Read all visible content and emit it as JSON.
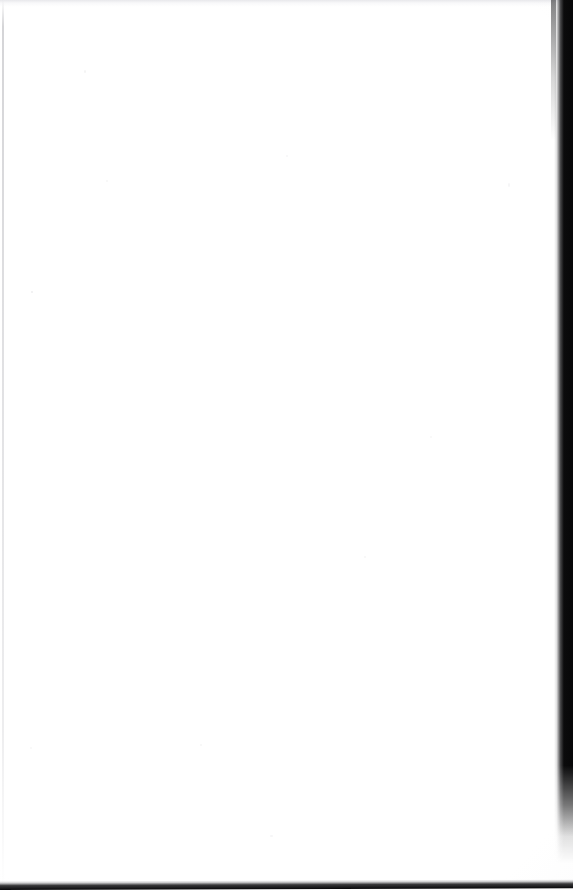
{
  "page": {
    "kind": "scanned-document-page",
    "content_text": "",
    "is_blank": true,
    "width_px": 573,
    "height_px": 890
  },
  "colors": {
    "paper": "#ffffff",
    "scanner_bed_dark": "#0b0b0c",
    "edge_line_gray": "#bcbcc0",
    "top_wash_gray": "#e4e4e8"
  },
  "regions": {
    "paper_label": "",
    "right_edge_label": "",
    "bottom_edge_label": "",
    "left_edge_label": "",
    "top_edge_label": ""
  }
}
